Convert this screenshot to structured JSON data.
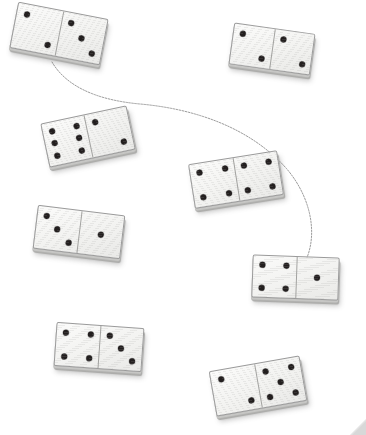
{
  "scene": {
    "title": "Dominoes scattered on white background",
    "width": 366,
    "height": 435,
    "background_color": "#ffffff",
    "tile_face_color": "#f5f5f3",
    "tile_edge_color": "#9a9a9a",
    "tile_shadow_color": "#b2b2b0",
    "pip_color": "#231f1f",
    "curve_color": "#8f8f8f",
    "curve_description": "faint thin S-shaped pencil curve connecting the top-left domino to the right-middle domino",
    "domino_count": 7,
    "corner_mark": "resize-handle-triangle"
  },
  "dominoes": [
    {
      "id": "domino-top-left",
      "label": "2 | 3",
      "left_pips": 2,
      "right_pips": 3,
      "x": 13,
      "y": 10,
      "width": 92,
      "height": 47,
      "rotation": 11
    },
    {
      "id": "domino-top-right",
      "label": "2 | 2",
      "left_pips": 2,
      "right_pips": 2,
      "x": 231,
      "y": 28,
      "width": 82,
      "height": 42,
      "rotation": 8
    },
    {
      "id": "domino-upper-left",
      "label": "6 | 2",
      "left_pips": 6,
      "right_pips": 2,
      "x": 44,
      "y": 114,
      "width": 88,
      "height": 45,
      "rotation": -12
    },
    {
      "id": "domino-center",
      "label": "4 | 4",
      "left_pips": 4,
      "right_pips": 4,
      "x": 191,
      "y": 157,
      "width": 90,
      "height": 45,
      "rotation": -9
    },
    {
      "id": "domino-middle-left",
      "label": "3 | 1",
      "left_pips": 3,
      "right_pips": 1,
      "x": 35,
      "y": 210,
      "width": 88,
      "height": 44,
      "rotation": 7
    },
    {
      "id": "domino-middle-right",
      "label": "4 | 1",
      "left_pips": 4,
      "right_pips": 1,
      "x": 252,
      "y": 256,
      "width": 87,
      "height": 43,
      "rotation": 2
    },
    {
      "id": "domino-bottom-left",
      "label": "4 | 3",
      "left_pips": 4,
      "right_pips": 3,
      "x": 55,
      "y": 325,
      "width": 88,
      "height": 44,
      "rotation": 4
    },
    {
      "id": "domino-bottom-right",
      "label": "2 | 5",
      "left_pips": 2,
      "right_pips": 5,
      "x": 212,
      "y": 363,
      "width": 92,
      "height": 46,
      "rotation": -10
    }
  ],
  "curve": {
    "path": "M 52 62 C 66 86, 96 100, 140 104 C 196 109, 250 128, 286 168 C 312 198, 318 236, 305 262 C 300 272, 296 276, 293 279",
    "stroke": "#8f8f8f",
    "stroke_width": 0.9,
    "dash": "1.6 1.4"
  }
}
